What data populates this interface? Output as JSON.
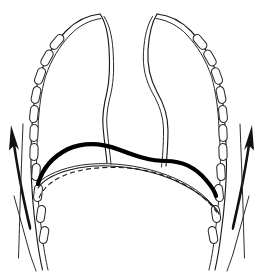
{
  "figure": {
    "type": "anatomical-line-drawing",
    "view": "frontal (coronal) chest outline",
    "background_color": "#ffffff",
    "ink_color": "#000000",
    "width": 263,
    "height": 273
  },
  "chart_data": {
    "type": "line",
    "xlabel": "",
    "ylabel": "",
    "grid": false,
    "legend_position": "none",
    "series": [
      {
        "name": "left-lung-outline-outer",
        "style": "thin-solid",
        "points": [
          [
            100,
            14
          ],
          [
            86,
            17
          ],
          [
            70,
            26
          ],
          [
            56,
            41
          ],
          [
            45,
            60
          ],
          [
            38,
            81
          ],
          [
            34,
            103
          ],
          [
            32,
            126
          ],
          [
            31,
            147
          ],
          [
            31,
            166
          ]
        ]
      },
      {
        "name": "left-lung-outline-inner",
        "style": "thin-solid",
        "points": [
          [
            100,
            18
          ],
          [
            88,
            21
          ],
          [
            74,
            30
          ],
          [
            61,
            44
          ],
          [
            50,
            63
          ],
          [
            43,
            84
          ],
          [
            39,
            105
          ],
          [
            37,
            127
          ],
          [
            36,
            148
          ],
          [
            36,
            166
          ]
        ]
      },
      {
        "name": "left-mediastinal-border-outer",
        "style": "thin-solid",
        "points": [
          [
            100,
            14
          ],
          [
            106,
            24
          ],
          [
            110,
            45
          ],
          [
            112,
            68
          ],
          [
            110,
            88
          ],
          [
            105,
            104
          ],
          [
            104,
            122
          ],
          [
            106,
            140
          ],
          [
            108,
            156
          ]
        ]
      },
      {
        "name": "left-mediastinal-border-inner",
        "style": "thin-solid",
        "points": [
          [
            104,
            16
          ],
          [
            110,
            26
          ],
          [
            114,
            46
          ],
          [
            116,
            69
          ],
          [
            114,
            89
          ],
          [
            110,
            105
          ],
          [
            109,
            123
          ],
          [
            111,
            141
          ],
          [
            113,
            157
          ]
        ]
      },
      {
        "name": "right-lung-outline-outer",
        "style": "thin-solid",
        "points": [
          [
            157,
            14
          ],
          [
            172,
            17
          ],
          [
            188,
            26
          ],
          [
            202,
            41
          ],
          [
            213,
            60
          ],
          [
            221,
            81
          ],
          [
            226,
            103
          ],
          [
            228,
            126
          ],
          [
            229,
            147
          ],
          [
            229,
            166
          ]
        ]
      },
      {
        "name": "right-lung-outline-inner",
        "style": "thin-solid",
        "points": [
          [
            157,
            18
          ],
          [
            170,
            21
          ],
          [
            184,
            30
          ],
          [
            197,
            44
          ],
          [
            208,
            63
          ],
          [
            216,
            84
          ],
          [
            221,
            105
          ],
          [
            223,
            127
          ],
          [
            224,
            148
          ],
          [
            224,
            166
          ]
        ]
      },
      {
        "name": "right-mediastinal-border-outer",
        "style": "thin-solid",
        "points": [
          [
            157,
            14
          ],
          [
            151,
            26
          ],
          [
            148,
            48
          ],
          [
            150,
            72
          ],
          [
            158,
            92
          ],
          [
            167,
            110
          ],
          [
            169,
            132
          ],
          [
            168,
            152
          ],
          [
            167,
            165
          ]
        ]
      },
      {
        "name": "right-mediastinal-border-inner",
        "style": "thin-solid",
        "points": [
          [
            153,
            16
          ],
          [
            147,
            27
          ],
          [
            144,
            49
          ],
          [
            146,
            73
          ],
          [
            154,
            93
          ],
          [
            163,
            111
          ],
          [
            165,
            133
          ],
          [
            164,
            153
          ],
          [
            163,
            166
          ]
        ]
      },
      {
        "name": "diaphragm-elevated-bold",
        "style": "bold-solid",
        "description": "diaphragm in full expiration / elevated position",
        "points": [
          [
            40,
            178
          ],
          [
            46,
            165
          ],
          [
            58,
            153
          ],
          [
            74,
            146
          ],
          [
            92,
            144
          ],
          [
            112,
            148
          ],
          [
            134,
            156
          ],
          [
            152,
            161
          ],
          [
            170,
            161
          ],
          [
            186,
            164
          ],
          [
            200,
            172
          ],
          [
            210,
            183
          ],
          [
            215,
            192
          ]
        ]
      },
      {
        "name": "diaphragm-mid-thin",
        "style": "thin-solid",
        "description": "diaphragm in intermediate position",
        "points": [
          [
            40,
            186
          ],
          [
            52,
            178
          ],
          [
            70,
            172
          ],
          [
            92,
            169
          ],
          [
            118,
            170
          ],
          [
            146,
            174
          ],
          [
            172,
            180
          ],
          [
            194,
            188
          ],
          [
            210,
            196
          ],
          [
            218,
            202
          ]
        ]
      },
      {
        "name": "diaphragm-depressed-dashed",
        "style": "dashed",
        "description": "diaphragm in full inspiration / depressed position",
        "points": [
          [
            40,
            196
          ],
          [
            52,
            186
          ],
          [
            72,
            178
          ],
          [
            96,
            174
          ],
          [
            124,
            174
          ],
          [
            152,
            178
          ],
          [
            178,
            186
          ],
          [
            198,
            196
          ],
          [
            212,
            206
          ],
          [
            218,
            212
          ]
        ]
      },
      {
        "name": "left-chest-wall-lower",
        "style": "thin-solid",
        "points": [
          [
            31,
            166
          ],
          [
            33,
            196
          ],
          [
            36,
            226
          ],
          [
            40,
            252
          ],
          [
            43,
            268
          ]
        ]
      },
      {
        "name": "right-chest-wall-lower",
        "style": "thin-solid",
        "points": [
          [
            229,
            166
          ],
          [
            228,
            196
          ],
          [
            225,
            226
          ],
          [
            221,
            252
          ],
          [
            218,
            268
          ]
        ]
      },
      {
        "name": "left-expansion-arrow",
        "style": "arrow",
        "description": "arrow indicating outward/upward chest wall expansion (left)",
        "from": [
          30,
          196
        ],
        "to": [
          10,
          128
        ]
      },
      {
        "name": "right-expansion-arrow",
        "style": "arrow",
        "description": "arrow indicating outward/upward chest wall expansion (right)",
        "from": [
          231,
          196
        ],
        "to": [
          251,
          128
        ]
      }
    ],
    "rib_count_left": 11,
    "rib_count_right": 11,
    "ribs_left": [
      [
        51,
        45,
        -52
      ],
      [
        43,
        62,
        -62
      ],
      [
        37,
        80,
        -72
      ],
      [
        34,
        98,
        -80
      ],
      [
        33,
        116,
        -86
      ],
      [
        33,
        134,
        -88
      ],
      [
        34,
        152,
        -88
      ],
      [
        36,
        170,
        -86
      ],
      [
        38,
        190,
        -84
      ],
      [
        41,
        210,
        -82
      ],
      [
        44,
        230,
        -80
      ]
    ],
    "ribs_right": [
      [
        211,
        45,
        52
      ],
      [
        219,
        62,
        62
      ],
      [
        225,
        80,
        72
      ],
      [
        228,
        98,
        80
      ],
      [
        229,
        116,
        86
      ],
      [
        229,
        134,
        88
      ],
      [
        228,
        152,
        88
      ],
      [
        226,
        170,
        86
      ],
      [
        224,
        190,
        84
      ],
      [
        221,
        210,
        82
      ],
      [
        218,
        230,
        80
      ]
    ]
  },
  "labels": {
    "none_visible": ""
  }
}
